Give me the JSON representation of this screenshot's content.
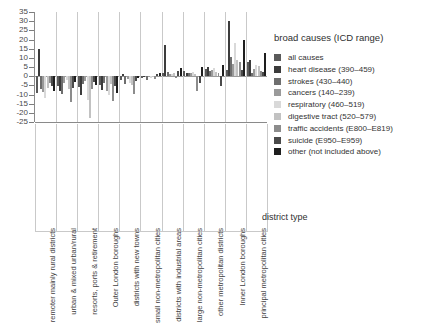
{
  "chart_data": {
    "type": "bar",
    "title": "",
    "xlabel": "district type",
    "ylabel": "",
    "ylim": [
      -25,
      35
    ],
    "yticks": [
      35,
      30,
      25,
      20,
      15,
      10,
      5,
      0,
      -5,
      -10,
      -15,
      -20,
      -25
    ],
    "grid": false,
    "legend_position": "right",
    "legend_title": "broad causes (ICD range)",
    "categories": [
      "remoter mainly rural districts",
      "urban & mixed urban/rural",
      "resorts, ports & retirement",
      "Outer London boroughs",
      "districts with new towns",
      "small non-metropolitan cities",
      "districts with industrial areas",
      "large non-metropolitan cities",
      "other metropolitan districts",
      "Inner London boroughs",
      "principal metropolitan cities"
    ],
    "series": [
      {
        "name": "all causes",
        "color": "#5a5a5a",
        "values": [
          -9.0,
          -5.5,
          -6.0,
          -5.0,
          -2.0,
          -1.0,
          1.5,
          3.0,
          4.0,
          3.5,
          7.5
        ]
      },
      {
        "name": "heart disease (390–459)",
        "color": "#3c3c3c",
        "values": [
          15.0,
          -8.0,
          -10.5,
          -7.5,
          1.0,
          -0.5,
          17.0,
          2.0,
          5.0,
          30.0,
          9.0
        ]
      },
      {
        "name": "strokes (430–440)",
        "color": "#6e6e6e",
        "values": [
          -7.0,
          -9.5,
          -4.5,
          -4.0,
          -4.5,
          -2.0,
          2.5,
          1.5,
          3.0,
          10.5,
          2.0
        ]
      },
      {
        "name": "cancers (140–239)",
        "color": "#9a9a9a",
        "values": [
          -8.5,
          -4.0,
          -2.5,
          -8.0,
          -1.5,
          -0.5,
          1.0,
          2.0,
          3.5,
          6.5,
          4.0
        ]
      },
      {
        "name": "respiratory (460–519)",
        "color": "#d9d9d9",
        "values": [
          -12.0,
          -2.0,
          -13.0,
          -10.5,
          -3.5,
          -1.0,
          1.0,
          2.5,
          4.5,
          18.0,
          6.0
        ]
      },
      {
        "name": "digestive tract (520–579)",
        "color": "#c2c2c2",
        "values": [
          -6.5,
          -7.0,
          -23.0,
          -4.5,
          -5.0,
          -0.5,
          2.0,
          1.0,
          2.5,
          9.0,
          5.5
        ]
      },
      {
        "name": "traffic accidents (E800–E819)",
        "color": "#8c8c8c",
        "values": [
          -4.0,
          -14.0,
          -7.0,
          -13.5,
          -10.0,
          -1.5,
          -1.0,
          -8.0,
          1.5,
          8.0,
          3.0
        ]
      },
      {
        "name": "suicide (E950–E959)",
        "color": "#4a4a4a",
        "values": [
          -5.5,
          -6.5,
          -3.0,
          -5.5,
          -2.5,
          1.0,
          3.0,
          -4.0,
          -5.5,
          3.5,
          2.5
        ]
      },
      {
        "name": "other (not included above)",
        "color": "#1e1e1e",
        "values": [
          -8.0,
          -3.0,
          -5.0,
          -9.0,
          -1.0,
          2.0,
          4.5,
          5.0,
          6.0,
          20.0,
          12.5
        ]
      }
    ]
  }
}
